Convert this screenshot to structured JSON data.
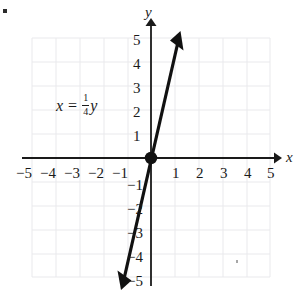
{
  "figure": {
    "title": "",
    "equation": {
      "lhs": "x",
      "operator": "=",
      "coefficient_numerator": "1",
      "coefficient_denominator": "4",
      "rhs_variable": "y",
      "plain_text": "x = 1/4 y"
    },
    "axis_names": {
      "x": "x",
      "y": "y"
    },
    "marker_bullet": "▪"
  },
  "chart_data": {
    "type": "line",
    "title": "",
    "xlabel": "x",
    "ylabel": "y",
    "equation": "x = (1/4)y",
    "slope": 4,
    "intercept": 0,
    "xlim": [
      -5,
      5
    ],
    "ylim": [
      -5,
      5
    ],
    "grid": true,
    "grid_spacing": 1,
    "legend": "none",
    "annotations": [
      {
        "text": "x = 1/4 y",
        "x": -3.1,
        "y": 2.3
      }
    ],
    "points": [
      {
        "x": 0,
        "y": 0,
        "marked": true,
        "label": "origin"
      }
    ],
    "line_endpoints": [
      {
        "x": -1.25,
        "y": -5
      },
      {
        "x": 1.25,
        "y": 5
      }
    ],
    "arrows": [
      "start",
      "end"
    ],
    "xticks": [
      -5,
      -4,
      -3,
      -2,
      -1,
      1,
      2,
      3,
      4,
      5
    ],
    "xtick_labels": [
      "−5",
      "−4",
      "−3",
      "−2",
      "−1",
      "1",
      "2",
      "3",
      "4",
      "5"
    ],
    "yticks": [
      5,
      4,
      3,
      2,
      1,
      -1,
      -2,
      -3,
      -4,
      -5
    ],
    "ytick_labels": [
      "5",
      "4",
      "3",
      "2",
      "1",
      "−1",
      "−2",
      "−3",
      "−4",
      "−5"
    ],
    "colors": {
      "line": "#111111",
      "axis": "#1a1a1a",
      "grid": "#e8e8ea",
      "background": "#ffffff",
      "text": "#1a1a1a"
    }
  },
  "x_tick_labels": [
    {
      "text": "−5",
      "left": 16,
      "top": 166
    },
    {
      "text": "−4",
      "left": 40,
      "top": 166
    },
    {
      "text": "−3",
      "left": 64,
      "top": 166
    },
    {
      "text": "−2",
      "left": 88,
      "top": 166
    },
    {
      "text": "−1",
      "left": 112,
      "top": 166
    },
    {
      "text": "1",
      "left": 172,
      "top": 166
    },
    {
      "text": "2",
      "left": 196,
      "top": 166
    },
    {
      "text": "3",
      "left": 220,
      "top": 166
    },
    {
      "text": "4",
      "left": 244,
      "top": 166
    },
    {
      "text": "5",
      "left": 267,
      "top": 166
    }
  ],
  "y_tick_labels": [
    {
      "text": "5",
      "left": 133,
      "top": 33
    },
    {
      "text": "4",
      "left": 133,
      "top": 57
    },
    {
      "text": "3",
      "left": 133,
      "top": 81
    },
    {
      "text": "2",
      "left": 133,
      "top": 105
    },
    {
      "text": "1",
      "left": 133,
      "top": 129
    },
    {
      "text": "−1",
      "left": 127,
      "top": 178
    },
    {
      "text": "−2",
      "left": 127,
      "top": 202
    },
    {
      "text": "−3",
      "left": 127,
      "top": 226
    },
    {
      "text": "−4",
      "left": 127,
      "top": 250
    },
    {
      "text": "−5",
      "left": 127,
      "top": 274
    }
  ],
  "axis_label_positions": {
    "x": {
      "left": 286,
      "top": 150
    },
    "y": {
      "left": 145,
      "top": 5
    }
  }
}
